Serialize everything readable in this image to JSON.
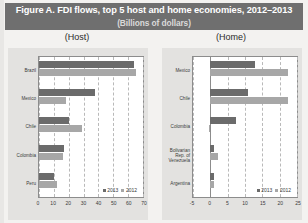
{
  "header": {
    "title": "Figure A. FDI flows, top 5 host and home economies, 2012–2013",
    "subtitle": "(Billions of dollars)",
    "banner_color": "#6f6f6f"
  },
  "legend": {
    "series_2013": "2013",
    "series_2012": "2012",
    "color_2013": "#6b6b6b",
    "color_2012": "#a7a7a7"
  },
  "panels": [
    {
      "label": "(Host)"
    },
    {
      "label": "(Home)"
    }
  ],
  "chart_data": [
    {
      "type": "bar",
      "orientation": "horizontal",
      "title": "(Host)",
      "xlabel": "",
      "ylabel": "",
      "xlim": [
        0,
        70
      ],
      "xticks": [
        0,
        10,
        20,
        30,
        40,
        50,
        60,
        70
      ],
      "xtick_labels": [
        "0",
        "10",
        "20",
        "30",
        "40",
        "50",
        "60",
        "70"
      ],
      "grid": true,
      "legend_position": "bottom-right",
      "categories": [
        "Brazil",
        "Mexico",
        "Chile",
        "Colombia",
        "Peru"
      ],
      "series": [
        {
          "name": "2013",
          "color": "#6b6b6b",
          "values": [
            64,
            38,
            20,
            17,
            10
          ]
        },
        {
          "name": "2012",
          "color": "#a7a7a7",
          "values": [
            65,
            18,
            29,
            16,
            12
          ]
        }
      ]
    },
    {
      "type": "bar",
      "orientation": "horizontal",
      "title": "(Home)",
      "xlabel": "",
      "ylabel": "",
      "xlim": [
        -5,
        25
      ],
      "xticks": [
        -5,
        0,
        5,
        10,
        15,
        20,
        25
      ],
      "xtick_labels": [
        "-5",
        "0",
        "5",
        "10",
        "15",
        "20",
        "25"
      ],
      "grid": true,
      "legend_position": "bottom-right",
      "categories": [
        "Mexico",
        "Chile",
        "Colombia",
        "Bolivarian Rep. of Venezuela",
        "Argentina"
      ],
      "category_lines": [
        [
          "Mexico"
        ],
        [
          "Chile"
        ],
        [
          "Colombia"
        ],
        [
          "Bolivarian",
          "Rep. of",
          "Venezuela"
        ],
        [
          "Argentina"
        ]
      ],
      "series": [
        {
          "name": "2013",
          "color": "#6b6b6b",
          "values": [
            13,
            11,
            7.5,
            1.0,
            1.0
          ]
        },
        {
          "name": "2012",
          "color": "#a7a7a7",
          "values": [
            22.5,
            22.5,
            -0.5,
            2.2,
            1.2
          ]
        }
      ]
    }
  ]
}
